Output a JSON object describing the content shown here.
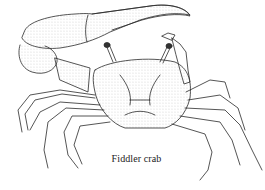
{
  "illustration": {
    "subject": "fiddler crab",
    "style": "pen-and-ink stipple drawing",
    "ink_color": "#2a2a2a",
    "background": "#ffffff"
  },
  "caption": {
    "text": "Fiddler crab"
  }
}
